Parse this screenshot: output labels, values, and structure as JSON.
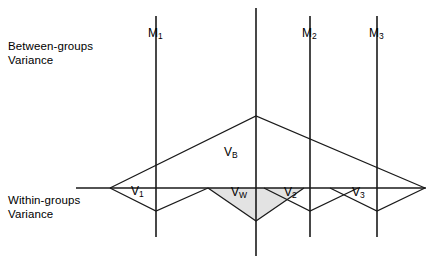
{
  "figure": {
    "title_labels": {
      "between": "Between-groups\nVariance",
      "within": "Within-groups\nVariance"
    },
    "mean_markers": [
      {
        "name": "M1",
        "base": "M",
        "sub": "1",
        "x": 156,
        "label_x": 148,
        "label_y": 34,
        "y_top": 16,
        "y_bottom": 237
      },
      {
        "name": "Mgrand",
        "base": "",
        "sub": "",
        "x": 256,
        "label_x": 0,
        "label_y": 0,
        "y_top": 8,
        "y_bottom": 256
      },
      {
        "name": "M2",
        "base": "M",
        "sub": "2",
        "x": 310,
        "label_x": 302,
        "label_y": 34,
        "y_top": 16,
        "y_bottom": 237
      },
      {
        "name": "M3",
        "base": "M",
        "sub": "3",
        "x": 377,
        "label_x": 369,
        "label_y": 34,
        "y_top": 16,
        "y_bottom": 237
      }
    ],
    "variance_labels": [
      {
        "name": "VB",
        "base": "V",
        "sub": "B",
        "x": 224,
        "y": 152
      },
      {
        "name": "V1",
        "base": "V",
        "sub": "1",
        "x": 131,
        "y": 191
      },
      {
        "name": "Vw",
        "base": "V",
        "sub": "W",
        "x": 231,
        "y": 192
      },
      {
        "name": "V2",
        "base": "V",
        "sub": "2",
        "x": 284,
        "y": 192
      },
      {
        "name": "V3",
        "base": "V",
        "sub": "3",
        "x": 352,
        "y": 192
      }
    ],
    "baseline": {
      "x1": 76,
      "x2": 426,
      "y": 188
    },
    "between_peak": {
      "apex_x": 256,
      "apex_y": 116,
      "left_x": 110,
      "right_x": 425
    },
    "within_triangles": [
      {
        "name": "V1",
        "left_x": 110,
        "bottom_x": 156,
        "right_x": 208,
        "bottom_y": 211
      },
      {
        "name": "Vw",
        "left_x": 208,
        "bottom_x": 256,
        "right_x": 304,
        "bottom_y": 221,
        "shaded": true
      },
      {
        "name": "V2",
        "left_x": 264,
        "bottom_x": 310,
        "right_x": 358,
        "bottom_y": 211
      },
      {
        "name": "V3",
        "left_x": 330,
        "bottom_x": 377,
        "right_x": 425,
        "bottom_y": 211
      }
    ],
    "colors": {
      "stroke": "#1a1a1a",
      "shade_fill": "#e3e3e3",
      "background": "#ffffff"
    }
  }
}
